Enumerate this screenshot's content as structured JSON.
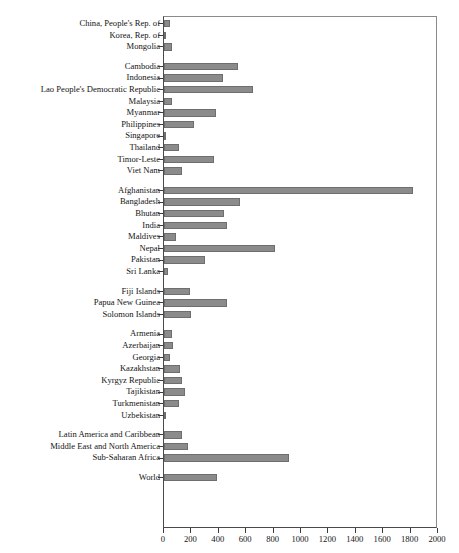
{
  "chart_data": {
    "type": "bar",
    "orientation": "horizontal",
    "title": "",
    "xlabel": "",
    "ylabel": "",
    "xlim": [
      0,
      2000
    ],
    "xticks": [
      0,
      200,
      400,
      600,
      800,
      1000,
      1200,
      1400,
      1600,
      1800,
      2000
    ],
    "grid": false,
    "legend": null,
    "bar_color": "#8b8b8b",
    "bar_edge_color": "#6e6e6e",
    "frame_color": "#4a4a4a",
    "groups": [
      {
        "name": "East Asia",
        "rows": [
          {
            "label": "China, People's Rep. of",
            "value": 45
          },
          {
            "label": "Korea, Rep. of",
            "value": 18
          },
          {
            "label": "Mongolia",
            "value": 55
          }
        ]
      },
      {
        "name": "Southeast Asia",
        "rows": [
          {
            "label": "Cambodia",
            "value": 540
          },
          {
            "label": "Indonesia",
            "value": 430
          },
          {
            "label": "Lao People's Democratic Republic",
            "value": 650
          },
          {
            "label": "Malaysia",
            "value": 60
          },
          {
            "label": "Myanmar",
            "value": 380
          },
          {
            "label": "Philippines",
            "value": 220
          },
          {
            "label": "Singapore",
            "value": 14
          },
          {
            "label": "Thailand",
            "value": 110
          },
          {
            "label": "Timor-Leste",
            "value": 365
          },
          {
            "label": "Viet Nam",
            "value": 130
          }
        ]
      },
      {
        "name": "South Asia",
        "rows": [
          {
            "label": "Afghanistan",
            "value": 1820
          },
          {
            "label": "Bangladesh",
            "value": 555
          },
          {
            "label": "Bhutan",
            "value": 440
          },
          {
            "label": "India",
            "value": 460
          },
          {
            "label": "Maldives",
            "value": 88
          },
          {
            "label": "Nepal",
            "value": 810
          },
          {
            "label": "Pakistan",
            "value": 300
          },
          {
            "label": "Sri Lanka",
            "value": 30
          }
        ]
      },
      {
        "name": "Pacific",
        "rows": [
          {
            "label": "Fiji Islands",
            "value": 190
          },
          {
            "label": "Papua New Guinea",
            "value": 460
          },
          {
            "label": "Solomon Islands",
            "value": 195
          }
        ]
      },
      {
        "name": "Central and West Asia",
        "rows": [
          {
            "label": "Armenia",
            "value": 60
          },
          {
            "label": "Azerbaijan",
            "value": 65
          },
          {
            "label": "Georgia",
            "value": 45
          },
          {
            "label": "Kazakhstan",
            "value": 120
          },
          {
            "label": "Kyrgyz Republic",
            "value": 130
          },
          {
            "label": "Tajikistan",
            "value": 155
          },
          {
            "label": "Turkmenistan",
            "value": 110
          },
          {
            "label": "Uzbekistan",
            "value": 15
          }
        ]
      },
      {
        "name": "Other regions",
        "rows": [
          {
            "label": "Latin America and Caribbean",
            "value": 130
          },
          {
            "label": "Middle East and North America",
            "value": 175
          },
          {
            "label": "Sub-Saharan Africa",
            "value": 910
          }
        ]
      },
      {
        "name": "Aggregate",
        "rows": [
          {
            "label": "World",
            "value": 390
          }
        ]
      }
    ]
  }
}
